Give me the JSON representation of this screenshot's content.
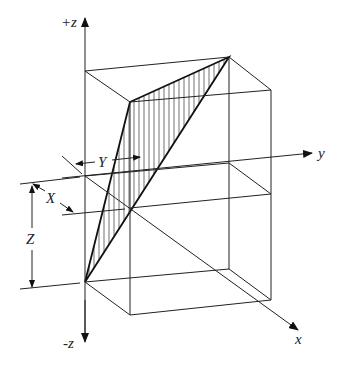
{
  "diagram": {
    "type": "3d-axes-box-with-shaded-plane",
    "axes": {
      "z_pos_label": "+z",
      "z_neg_label": "-z",
      "y_label": "y",
      "x_label": "x"
    },
    "dimensions": {
      "X_label": "X",
      "Y_label": "Y",
      "Z_label": "Z"
    },
    "colors": {
      "line": "#222222",
      "background": "#ffffff"
    },
    "shaded_region": "hatched triangular plane inside rectangular box"
  }
}
